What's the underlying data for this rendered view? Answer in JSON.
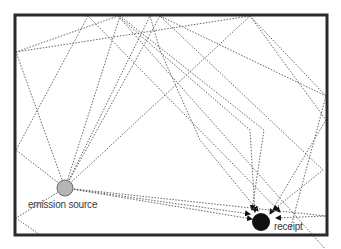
{
  "diagram": {
    "frame": {
      "x": 15,
      "y": 15,
      "w": 312,
      "h": 220,
      "stroke": "#2b2b2b"
    },
    "source": {
      "label": "emission source",
      "cx": 65,
      "cy": 188,
      "r": 8,
      "fill": "#b5b5b5",
      "stroke": "#6a6a6a"
    },
    "receiver": {
      "label": "receipt",
      "cx": 261,
      "cy": 222,
      "r": 9,
      "fill": "#111111"
    },
    "ray_color": "#666666",
    "rays": [
      [
        [
          65,
          188
        ],
        [
          16,
          52
        ],
        [
          118,
          16
        ],
        [
          250,
          130
        ],
        [
          255,
          212
        ]
      ],
      [
        [
          65,
          188
        ],
        [
          16,
          150
        ],
        [
          88,
          16
        ],
        [
          280,
          212
        ]
      ],
      [
        [
          65,
          188
        ],
        [
          120,
          16
        ],
        [
          264,
          130
        ],
        [
          252,
          210
        ]
      ],
      [
        [
          65,
          188
        ],
        [
          160,
          16
        ],
        [
          323,
          170
        ],
        [
          273,
          210
        ]
      ],
      [
        [
          65,
          188
        ],
        [
          150,
          16
        ],
        [
          160,
          50
        ],
        [
          200,
          140
        ],
        [
          258,
          211
        ]
      ],
      [
        [
          65,
          188
        ],
        [
          250,
          16
        ],
        [
          326,
          120
        ],
        [
          270,
          214
        ]
      ],
      [
        [
          65,
          188
        ],
        [
          326,
          216
        ],
        [
          276,
          218
        ]
      ],
      [
        [
          65,
          188
        ],
        [
          252,
          219
        ]
      ],
      [
        [
          65,
          188
        ],
        [
          250,
          214
        ]
      ],
      [
        [
          65,
          188
        ],
        [
          16,
          218
        ],
        [
          40,
          235
        ]
      ],
      [
        [
          16,
          52
        ],
        [
          250,
          16
        ],
        [
          326,
          96
        ],
        [
          290,
          230
        ]
      ],
      [
        [
          160,
          16
        ],
        [
          326,
          96
        ]
      ],
      [
        [
          118,
          16
        ],
        [
          326,
          250
        ]
      ]
    ]
  }
}
